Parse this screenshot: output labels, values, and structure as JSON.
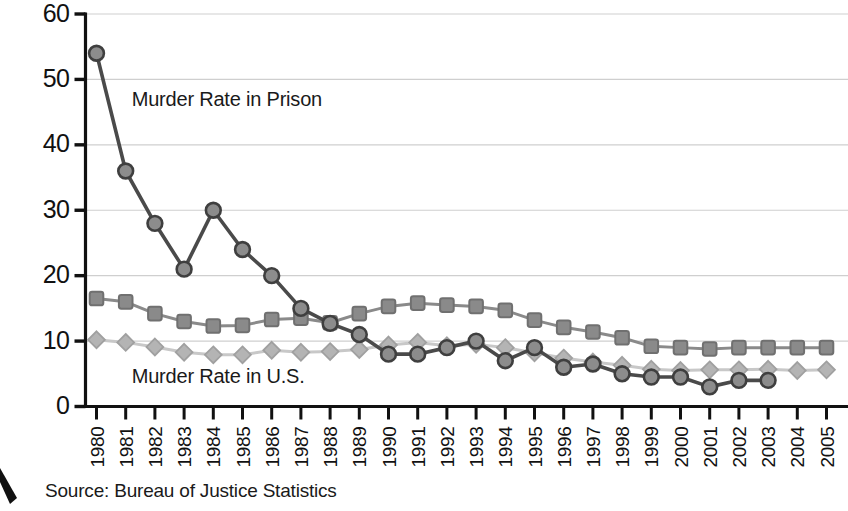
{
  "chart_data": {
    "type": "line",
    "title": "",
    "subtitle": "",
    "xlabel": "",
    "ylabel": "",
    "ylim": [
      0,
      60
    ],
    "ytick_values": [
      0,
      10,
      20,
      30,
      40,
      50,
      60
    ],
    "ytick_labels": [
      "0",
      "10",
      "20",
      "30",
      "40",
      "50",
      "60"
    ],
    "grid": "horizontal",
    "legend_position": "inline-annotation",
    "categories": [
      "1980",
      "1981",
      "1982",
      "1983",
      "1984",
      "1985",
      "1986",
      "1987",
      "1988",
      "1989",
      "1990",
      "1991",
      "1992",
      "1993",
      "1994",
      "1995",
      "1996",
      "1997",
      "1998",
      "1999",
      "2000",
      "2001",
      "2002",
      "2003",
      "2004",
      "2005"
    ],
    "series": [
      {
        "name": "Murder Rate in Prison",
        "marker": "circle",
        "color": "#8c8c8c",
        "line_color": "#4a4a4a",
        "values": [
          54,
          36,
          28,
          21,
          30,
          24,
          20,
          15,
          12.7,
          11,
          8,
          8,
          9,
          10,
          7,
          9,
          6,
          6.5,
          5,
          4.5,
          4.5,
          3,
          4,
          4,
          null,
          null
        ]
      },
      {
        "name": "Murder Rate in State Prison",
        "marker": "square",
        "color": "#8a8a8a",
        "line_color": "#8a8a8a",
        "values": [
          16.5,
          16,
          14.2,
          13,
          12.3,
          12.4,
          13.3,
          13.5,
          12.8,
          14.2,
          15.3,
          15.8,
          15.5,
          15.3,
          14.7,
          13.2,
          12.1,
          11.4,
          10.5,
          9.2,
          9,
          8.8,
          9,
          9,
          9,
          9
        ]
      },
      {
        "name": "Murder Rate in U.S.",
        "marker": "diamond",
        "color": "#b4b4b4",
        "line_color": "#c8c8c8",
        "values": [
          10.2,
          9.8,
          9.1,
          8.3,
          7.9,
          7.9,
          8.6,
          8.3,
          8.4,
          8.7,
          9.4,
          9.8,
          9.3,
          9.5,
          9,
          8.2,
          7.4,
          6.8,
          6.3,
          5.7,
          5.5,
          5.6,
          5.6,
          5.7,
          5.5,
          5.6
        ]
      }
    ],
    "annotations": [
      {
        "text": "Murder Rate in Prison",
        "x_year": "1981",
        "y_value": 46
      },
      {
        "text": "Murder Rate in U.S.",
        "x_year": "1981",
        "y_value": 3.6
      }
    ]
  },
  "footer": {
    "source": "Source: Bureau of Justice Statistics"
  }
}
